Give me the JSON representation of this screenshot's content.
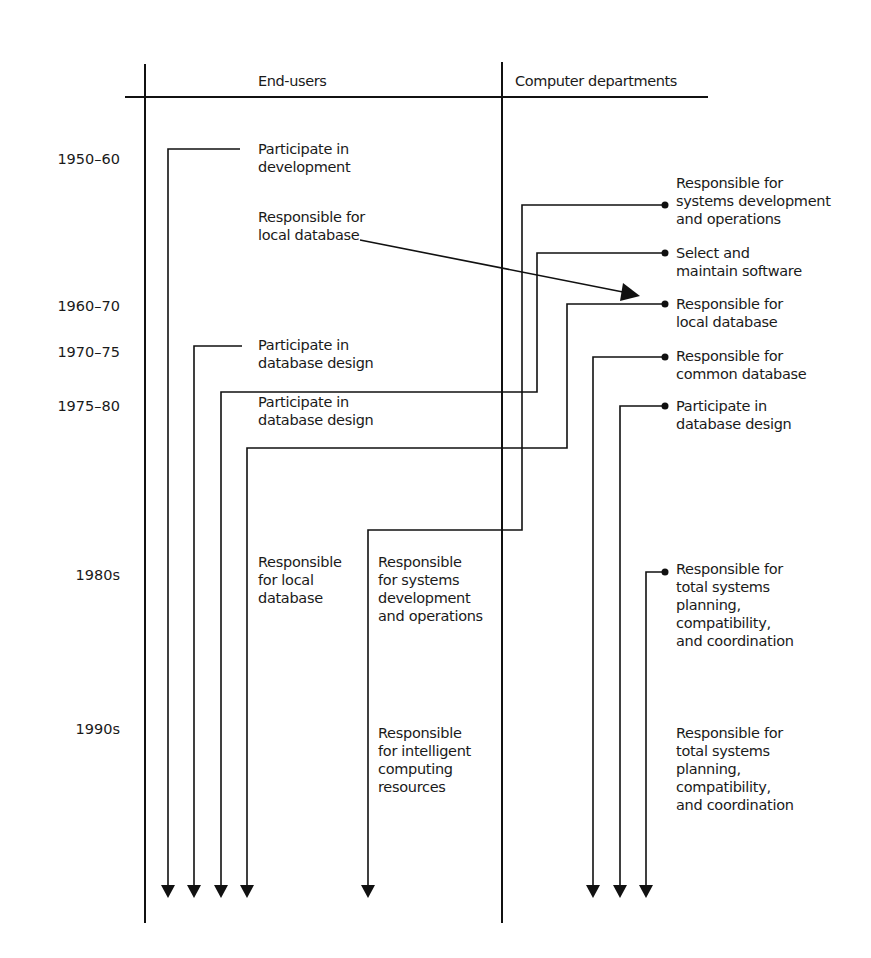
{
  "header": {
    "left_column": "End-users",
    "right_column": "Computer departments"
  },
  "eras": [
    {
      "label": "1950–60",
      "y": 150
    },
    {
      "label": "1960–70",
      "y": 297
    },
    {
      "label": "1970–75",
      "y": 343
    },
    {
      "label": "1975–80",
      "y": 397
    },
    {
      "label": "1980s",
      "y": 566
    },
    {
      "label": "1990s",
      "y": 720
    }
  ],
  "end_user_labels": [
    {
      "id": "eu-participate-development",
      "text": "Participate in\ndevelopment",
      "x": 258,
      "y": 140
    },
    {
      "id": "eu-responsible-local-db-1960",
      "text": "Responsible for\nlocal database",
      "x": 258,
      "y": 208
    },
    {
      "id": "eu-participate-db-design-1970",
      "text": "Participate in\ndatabase design",
      "x": 258,
      "y": 336
    },
    {
      "id": "eu-participate-db-design-1975",
      "text": "Participate in\ndatabase design",
      "x": 258,
      "y": 393
    },
    {
      "id": "eu-responsible-local-db-1980",
      "text": "Responsible\nfor local\ndatabase",
      "x": 258,
      "y": 553
    },
    {
      "id": "eu-responsible-systems-dev-1980",
      "text": "Responsible\nfor systems\ndevelopment\nand operations",
      "x": 378,
      "y": 553
    },
    {
      "id": "eu-responsible-intelligent-1990",
      "text": "Responsible\nfor intelligent\ncomputing\nresources",
      "x": 378,
      "y": 724
    }
  ],
  "computer_dept_labels": [
    {
      "id": "cd-systems-dev",
      "text": "Responsible for\nsystems development\nand operations",
      "x": 676,
      "y": 174
    },
    {
      "id": "cd-select-software",
      "text": "Select and\nmaintain software",
      "x": 676,
      "y": 244
    },
    {
      "id": "cd-local-db",
      "text": "Responsible for\nlocal database",
      "x": 676,
      "y": 295
    },
    {
      "id": "cd-common-db",
      "text": "Responsible for\ncommon database",
      "x": 676,
      "y": 347
    },
    {
      "id": "cd-participate-db-design",
      "text": "Participate in\ndatabase design",
      "x": 676,
      "y": 397
    },
    {
      "id": "cd-total-systems-1980",
      "text": "Responsible for\ntotal systems\nplanning,\ncompatibility,\nand coordination",
      "x": 676,
      "y": 560
    },
    {
      "id": "cd-total-systems-1990",
      "text": "Responsible for\ntotal systems\nplanning,\ncompatibility,\nand coordination",
      "x": 676,
      "y": 724
    }
  ],
  "colors": {
    "line": "#111111",
    "text": "#1a1a1a",
    "background": "#ffffff"
  }
}
